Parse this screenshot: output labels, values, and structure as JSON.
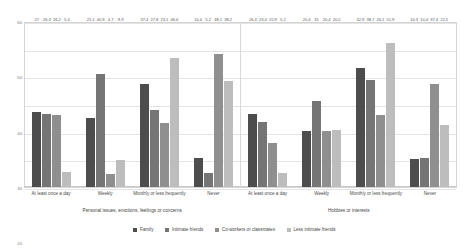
{
  "chart_data": {
    "type": "bar",
    "title": "",
    "xlabel": "",
    "ylabel": "",
    "ylim": [
      0,
      60
    ],
    "yticks": [
      "0",
      "10",
      "20",
      "30",
      "40",
      "50",
      "60"
    ],
    "grid": true,
    "legend_position": "bottom",
    "categories": [
      "At least once a day",
      "Weekly",
      "Monthly or less frequently",
      "Never"
    ],
    "panels": [
      {
        "title": "Personal issues, emotions, feelings or concerns",
        "series": [
          {
            "name": "Family",
            "values": [
              27,
              25.1,
              37.4,
              10.4
            ]
          },
          {
            "name": "Intimate friends",
            "values": [
              26.3,
              40.9,
              27.8,
              5.2
            ]
          },
          {
            "name": "Co-workers or classmates",
            "values": [
              26.2,
              4.7,
              23.1,
              48.1
            ]
          },
          {
            "name": "Less intimate friends",
            "values": [
              5.4,
              9.9,
              46.6,
              38.2
            ]
          }
        ],
        "labels": [
          [
            "27",
            "26,3",
            "26,2",
            "5,4"
          ],
          [
            "25,1",
            "40,9",
            "4,7",
            "9,9"
          ],
          [
            "37,4",
            "27,8",
            "23,1",
            "46,6"
          ],
          [
            "10,4",
            "5,2",
            "48,1",
            "38,2"
          ]
        ]
      },
      {
        "title": "Hobbies or interests",
        "series": [
          {
            "name": "Family",
            "values": [
              26.4,
              20.4,
              42.9,
              10.3
            ]
          },
          {
            "name": "Intimate friends",
            "values": [
              23.4,
              31,
              38.7,
              10.4
            ]
          },
          {
            "name": "Co-workers or classmates",
            "values": [
              15.9,
              20.4,
              26.1,
              37.4
            ]
          },
          {
            "name": "Less intimate friends",
            "values": [
              5.2,
              20.5,
              51.9,
              22.5
            ]
          }
        ],
        "labels": [
          [
            "26,4",
            "23,4",
            "15,9",
            "5,2"
          ],
          [
            "20,4",
            "31",
            "20,4",
            "20,5"
          ],
          [
            "42,9",
            "38,7",
            "26,1",
            "51,9"
          ],
          [
            "10,3",
            "10,4",
            "37,4",
            "22,5"
          ]
        ]
      }
    ],
    "legend": [
      {
        "label": "Family",
        "color": "#4d4d4d"
      },
      {
        "label": "Intimate friends",
        "color": "#757575"
      },
      {
        "label": "Co-workers or classmates",
        "color": "#8f8f8f"
      },
      {
        "label": "Less intimate friends",
        "color": "#bdbdbd"
      }
    ]
  }
}
